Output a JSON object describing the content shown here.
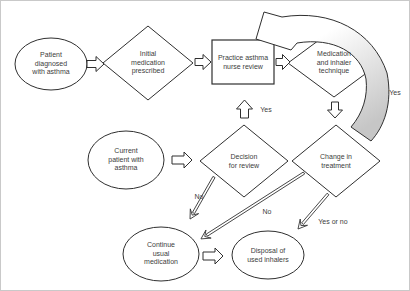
{
  "colors": {
    "stroke": "#2f2f2f",
    "text": "#3d3d3d",
    "background": "#ffffff",
    "loop_arrow_fill_start": "#ffffff",
    "loop_arrow_fill_end": "#c6c6c6"
  },
  "nodes": {
    "patient_diagnosed": {
      "shape": "ellipse",
      "label": "Patient\ndiagnosed\nwith asthma"
    },
    "initial_medication": {
      "shape": "diamond",
      "label": "Initial\nmedication\nprescribed"
    },
    "nurse_review": {
      "shape": "rectangle",
      "label": "Practice asthma\nnurse review"
    },
    "medication_technique": {
      "shape": "diamond",
      "label": "Medication\nand inhaler\ntechnique"
    },
    "current_patient": {
      "shape": "ellipse",
      "label": "Current\npatient with\nasthma"
    },
    "decision_review": {
      "shape": "diamond",
      "label": "Decision\nfor review"
    },
    "change_treatment": {
      "shape": "diamond",
      "label": "Change in\ntreatment"
    },
    "continue_medication": {
      "shape": "ellipse",
      "label": "Continue\nusual\nmedication"
    },
    "disposal_inhalers": {
      "shape": "ellipse",
      "label": "Disposal of\nused inhalers"
    }
  },
  "edge_labels": {
    "review_yes": "Yes",
    "loop_yes": "Yes",
    "decision_no": "No",
    "change_no": "No",
    "change_yes_or_no": "Yes or no"
  }
}
